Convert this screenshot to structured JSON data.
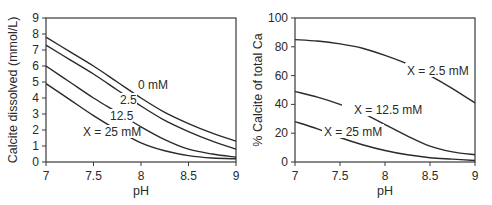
{
  "chart_data": [
    {
      "type": "line",
      "title": "",
      "xlabel": "pH",
      "ylabel": "Calcite dissolved (mmol/L)",
      "xlim": [
        7,
        9
      ],
      "ylim": [
        0,
        9
      ],
      "xticks": [
        "7",
        "7.5",
        "8",
        "8.5",
        "9"
      ],
      "yticks": [
        "0",
        "1",
        "2",
        "3",
        "4",
        "5",
        "6",
        "7",
        "8",
        "9"
      ],
      "grid": false,
      "x": [
        7,
        7.25,
        7.5,
        7.75,
        8,
        8.25,
        8.5,
        8.75,
        9
      ],
      "series": [
        {
          "name": "0 mM",
          "values": [
            7.8,
            6.9,
            6.0,
            5.0,
            4.0,
            3.1,
            2.4,
            1.8,
            1.3
          ]
        },
        {
          "name": "2.5",
          "values": [
            7.3,
            6.4,
            5.5,
            4.5,
            3.5,
            2.6,
            1.9,
            1.3,
            0.8
          ]
        },
        {
          "name": "12.5",
          "values": [
            6.0,
            5.0,
            4.0,
            3.1,
            2.2,
            1.4,
            0.8,
            0.5,
            0.3
          ]
        },
        {
          "name": "X = 25 mM",
          "values": [
            4.9,
            3.9,
            2.9,
            2.0,
            1.2,
            0.7,
            0.4,
            0.25,
            0.2
          ]
        }
      ],
      "annotations": [
        "0 mM",
        "2.5",
        "12.5",
        "X = 25 mM"
      ]
    },
    {
      "type": "line",
      "title": "",
      "xlabel": "pH",
      "ylabel": "% Calcite of total Ca",
      "xlim": [
        7,
        9
      ],
      "ylim": [
        0,
        100
      ],
      "xticks": [
        "7",
        "7.5",
        "8",
        "8.5",
        "9"
      ],
      "yticks": [
        "0",
        "20",
        "40",
        "60",
        "80",
        "100"
      ],
      "grid": false,
      "x": [
        7,
        7.25,
        7.5,
        7.75,
        8,
        8.25,
        8.5,
        8.75,
        9
      ],
      "series": [
        {
          "name": "X = 2.5 mM",
          "values": [
            85,
            84,
            82,
            79,
            74,
            68,
            60,
            51,
            41
          ]
        },
        {
          "name": "X = 12.5 mM",
          "values": [
            49,
            45,
            40,
            34,
            26,
            18,
            11,
            7,
            5
          ]
        },
        {
          "name": "X = 25 mM",
          "values": [
            28,
            23,
            17,
            12,
            8,
            5,
            3,
            2,
            1
          ]
        }
      ],
      "annotations": [
        "X = 2.5 mM",
        "X = 12.5 mM",
        "X = 25 mM"
      ]
    }
  ]
}
